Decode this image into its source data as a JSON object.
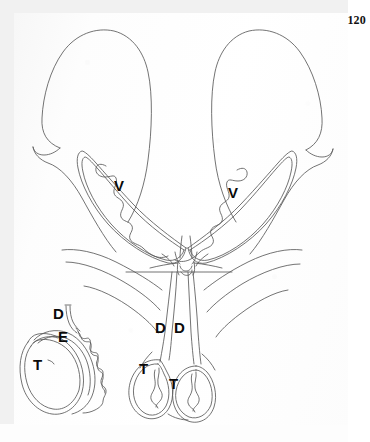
{
  "document": {
    "type": "scanned-book-page",
    "page_number": "120",
    "background_color": "#fefefe",
    "margin_color": "#f1f1f1",
    "ink_color": "#555555",
    "label_color": "#0a0a0a"
  },
  "figure": {
    "name": "anatomical-line-drawing",
    "labels": [
      {
        "id": "v-left",
        "text": "V",
        "x": 118,
        "y": 185,
        "meaning": "vas-deferens-coil-left"
      },
      {
        "id": "v-right",
        "text": "V",
        "x": 232,
        "y": 192,
        "meaning": "vas-deferens-coil-right"
      },
      {
        "id": "d-inset",
        "text": "D",
        "x": 57,
        "y": 313,
        "meaning": "ductus-deferens-inset"
      },
      {
        "id": "e-inset",
        "text": "E",
        "x": 62,
        "y": 336,
        "meaning": "epididymis-inset"
      },
      {
        "id": "t-inset",
        "text": "T",
        "x": 37,
        "y": 364,
        "meaning": "testis-inset"
      },
      {
        "id": "d-mid-left",
        "text": "D",
        "x": 158,
        "y": 327,
        "meaning": "ductus-deferens-left"
      },
      {
        "id": "d-mid-right",
        "text": "D",
        "x": 177,
        "y": 327,
        "meaning": "ductus-deferens-right"
      },
      {
        "id": "t-lower-left",
        "text": "T",
        "x": 142,
        "y": 368,
        "meaning": "testis-left"
      },
      {
        "id": "t-lower-right",
        "text": "T",
        "x": 172,
        "y": 383,
        "meaning": "testis-right"
      }
    ]
  }
}
